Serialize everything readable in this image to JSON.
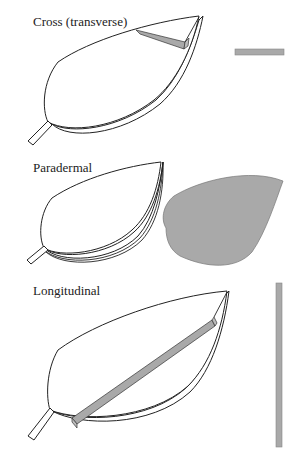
{
  "colors": {
    "outline": "#222222",
    "section_fill": "#a9a9a9",
    "background": "#ffffff"
  },
  "panels": [
    {
      "id": "cross",
      "label": "Cross (transverse)",
      "result_shape": "horizontal thin strip"
    },
    {
      "id": "paradermal",
      "label": "Paradermal",
      "result_shape": "filled leaf blade"
    },
    {
      "id": "longitudinal",
      "label": "Longitudinal",
      "result_shape": "long vertical strip"
    }
  ]
}
